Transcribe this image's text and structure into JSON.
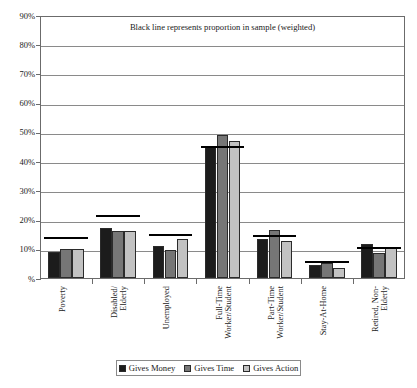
{
  "chart_data": {
    "type": "bar",
    "title": "Black line represents proportion in sample (weighted)",
    "xlabel": "",
    "ylabel": "",
    "ylim": [
      0,
      90
    ],
    "ytick_labels": [
      "90%",
      "80%",
      "70%",
      "60%",
      "50%",
      "40%",
      "30%",
      "20%",
      "10%",
      "%"
    ],
    "ytick_values": [
      90,
      80,
      70,
      60,
      50,
      40,
      30,
      20,
      10,
      0
    ],
    "grid": true,
    "legend_position": "bottom",
    "categories": [
      "Poverty",
      "Disabled/\nElderly",
      "Unemployed",
      "Full-Time\nWorker/Student",
      "Part-Time\nWorker/Student",
      "Stay-At-Home",
      "Retired, Non-\nElderly"
    ],
    "series": [
      {
        "name": "Gives Money",
        "color": "#1c1c1c",
        "values": [
          9.0,
          17.0,
          11.0,
          45.0,
          13.5,
          4.5,
          11.5
        ]
      },
      {
        "name": "Gives Time",
        "color": "#767676",
        "values": [
          10.0,
          16.0,
          9.5,
          49.0,
          16.5,
          5.0,
          8.5
        ]
      },
      {
        "name": "Gives Action",
        "color": "#c2c2c2",
        "values": [
          10.0,
          16.0,
          13.5,
          47.0,
          12.5,
          3.5,
          10.5
        ]
      }
    ],
    "overlay": {
      "name": "Proportion in sample (weighted)",
      "color": "#000000",
      "values": [
        13.5,
        21.0,
        14.5,
        44.5,
        14.0,
        5.0,
        10.0
      ]
    }
  },
  "legend": {
    "items": [
      {
        "label": "Gives Money"
      },
      {
        "label": "Gives Time"
      },
      {
        "label": "Gives Action"
      }
    ]
  }
}
